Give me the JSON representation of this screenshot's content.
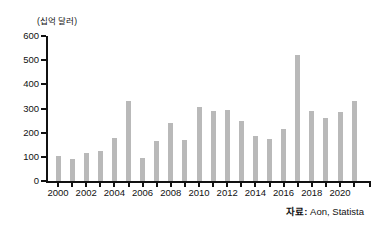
{
  "chart": {
    "unit_label": "(십억 달러)",
    "source_prefix": "자료:",
    "source_text": " Aon, Statista"
  },
  "chart_data": {
    "type": "bar",
    "title": "",
    "xlabel": "",
    "ylabel": "(십억 달러)",
    "categories": [
      "2000",
      "2001",
      "2002",
      "2003",
      "2004",
      "2005",
      "2006",
      "2007",
      "2008",
      "2009",
      "2010",
      "2011",
      "2012",
      "2013",
      "2014",
      "2015",
      "2016",
      "2017",
      "2018",
      "2019",
      "2020",
      "2021"
    ],
    "values": [
      105,
      90,
      115,
      125,
      180,
      330,
      95,
      165,
      240,
      170,
      305,
      290,
      295,
      250,
      185,
      175,
      215,
      520,
      290,
      260,
      285,
      330
    ],
    "ylim": [
      0,
      600
    ],
    "ytick_interval": 100,
    "ytick_labels": [
      "0",
      "100",
      "200",
      "300",
      "400",
      "500",
      "600"
    ],
    "xtick_labels": [
      "2000",
      "2002",
      "2004",
      "2006",
      "2008",
      "2010",
      "2012",
      "2014",
      "2016",
      "2018",
      "2020"
    ],
    "grid": false,
    "legend": "none",
    "bar_color": "#b9b9b9",
    "source": "자료: Aon, Statista"
  }
}
